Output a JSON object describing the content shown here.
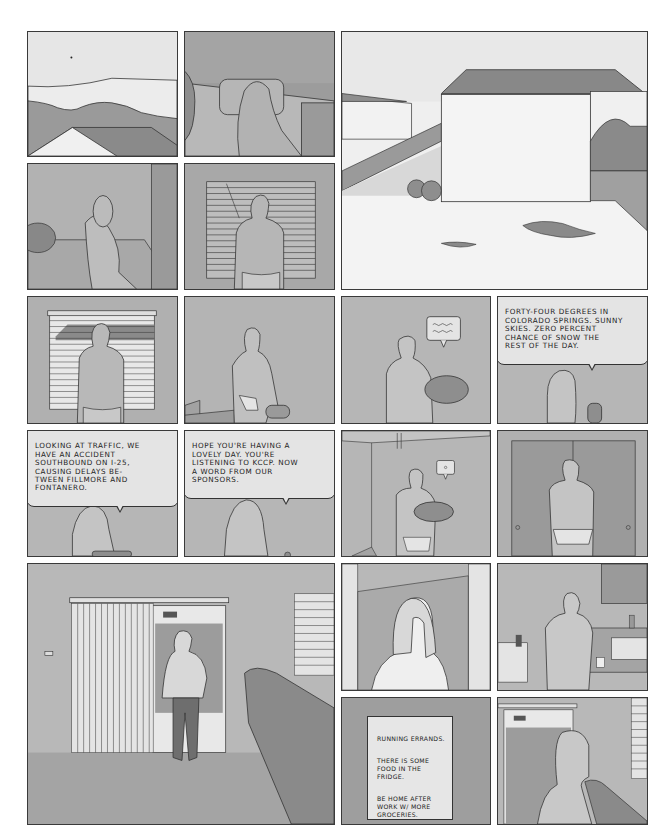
{
  "page": {
    "background": "#ffffff",
    "panel_border": "#3a3a3a",
    "tones": {
      "light": "#e6e6e6",
      "mid": "#b9b9b9",
      "dark": "#8f8f8f"
    }
  },
  "panels": [
    {
      "id": 1,
      "scene": "landscape-mountains-rooftop"
    },
    {
      "id": 2,
      "scene": "woman-waking-in-bed"
    },
    {
      "id": 3,
      "scene": "suburban-snowy-backyard-house"
    },
    {
      "id": 4,
      "scene": "woman-sitting-on-bed-edge"
    },
    {
      "id": 5,
      "scene": "woman-facing-closed-blinds"
    },
    {
      "id": 6,
      "scene": "woman-at-window-blinds-open"
    },
    {
      "id": 7,
      "scene": "woman-picking-up-radio"
    },
    {
      "id": 8,
      "scene": "woman-holding-radio",
      "bubble_icon": "squiggle-speech"
    },
    {
      "id": 9,
      "scene": "radio-announcement-weather",
      "bubble": "FORTY-FOUR DEGREES IN\nCOLORADO SPRINGS. SUNNY\nSKIES. ZERO PERCENT\nCHANCE OF SNOW THE\nREST OF THE DAY."
    },
    {
      "id": 10,
      "scene": "radio-announcement-traffic",
      "bubble": "LOOKING AT TRAFFIC, WE\nHAVE AN ACCIDENT\nSOUTHBOUND ON I-25,\nCAUSING DELAYS BE-\nTWEEN FILLMORE AND\nFONTANERO."
    },
    {
      "id": 11,
      "scene": "radio-announcement-sponsors",
      "bubble": "HOPE YOU'RE HAVING A\nLOVELY DAY. YOU'RE\nLISTENING TO KCCP. NOW\nA WORD FROM OUR\nSPONSORS."
    },
    {
      "id": 12,
      "scene": "woman-carrying-radio-room",
      "bubble_icon": "sparkle-speech"
    },
    {
      "id": 13,
      "scene": "woman-at-closet-doors"
    },
    {
      "id": 14,
      "scene": "man-standing-at-sliding-door"
    },
    {
      "id": 15,
      "scene": "woman-face-in-doorway"
    },
    {
      "id": 16,
      "scene": "woman-walking-into-kitchen"
    },
    {
      "id": 17,
      "scene": "handwritten-note",
      "note": [
        "RUNNING ERRANDS.",
        "THERE IS SOME\nFOOD IN THE\nFRIDGE.",
        "BE HOME AFTER\nWORK W/ MORE\nGROCERIES."
      ]
    },
    {
      "id": 18,
      "scene": "woman-looking-out-sliding-door"
    }
  ]
}
